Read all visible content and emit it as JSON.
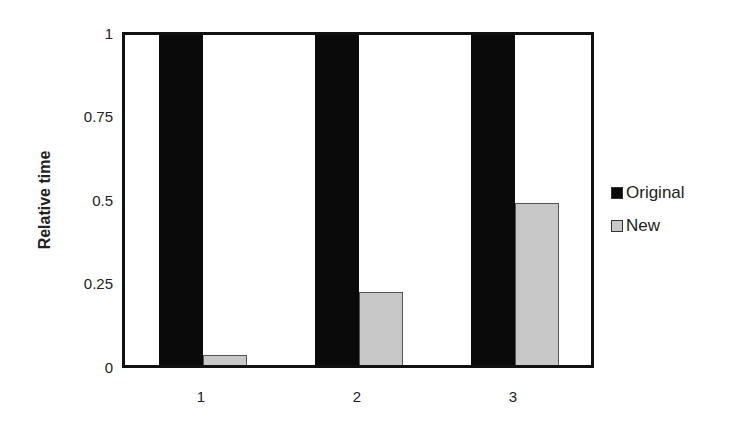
{
  "chart_data": {
    "type": "bar",
    "title": "",
    "xlabel": "",
    "ylabel": "Relative time",
    "ylim": [
      0,
      1
    ],
    "yticks": [
      "0",
      "0.25",
      "0.5",
      "0.75",
      "1"
    ],
    "grid": false,
    "legend_position": "right",
    "categories": [
      "1",
      "2",
      "3"
    ],
    "series": [
      {
        "name": "Original",
        "color": "#0a0a0a",
        "values": [
          1,
          1,
          1
        ]
      },
      {
        "name": "New",
        "color": "#c8c8c8",
        "values": [
          0.03,
          0.22,
          0.49
        ]
      }
    ]
  }
}
